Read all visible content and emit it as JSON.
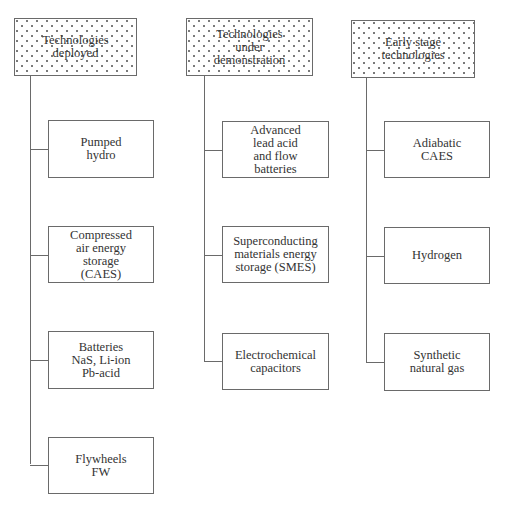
{
  "diagram": {
    "type": "tree",
    "columns": [
      {
        "header": "Technologies\ndeployed",
        "children": [
          "Pumped\nhydro",
          "Compressed\nair energy\nstorage\n(CAES)",
          "Batteries\nNaS, Li-ion\nPb-acid",
          "Flywheels\nFW"
        ]
      },
      {
        "header": "Technologies\nunder\ndemonstration",
        "children": [
          "Advanced\nlead acid\nand flow\nbatteries",
          "Superconducting\nmaterials energy\nstorage (SMES)",
          "Electrochemical\ncapacitors"
        ]
      },
      {
        "header": "Early stage\ntechnologies",
        "children": [
          "Adiabatic\nCAES",
          "Hydrogen",
          "Synthetic\nnatural gas"
        ]
      }
    ]
  }
}
